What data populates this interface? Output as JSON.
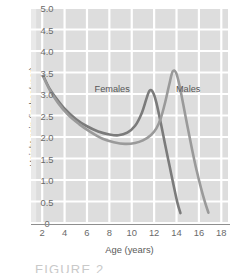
{
  "chart_data": {
    "type": "line",
    "title": "",
    "xlabel": "Age (years)",
    "ylabel": "Height gain (inches/year)",
    "xlim": [
      1,
      18.6
    ],
    "ylim": [
      0,
      5.0
    ],
    "xticks": [
      "2",
      "4",
      "6",
      "8",
      "10",
      "12",
      "14",
      "16",
      "18"
    ],
    "xtick_values": [
      2,
      4,
      6,
      8,
      10,
      12,
      14,
      16,
      18
    ],
    "yticks": [
      "5.0",
      "4.5",
      "4.0",
      "3.5",
      "3.0",
      "2.5",
      "2.0",
      "1.5",
      "1.0",
      "0.5",
      "0"
    ],
    "ytick_values": [
      5.0,
      4.5,
      4.0,
      3.5,
      3.0,
      2.5,
      2.0,
      1.5,
      1.0,
      0.5,
      0
    ],
    "grid": true,
    "grid_color": "#ffffff",
    "plot_background": "#dddddd",
    "legend_position": "inline-annotations",
    "series": [
      {
        "name": "Females",
        "color": "#7b7b7b",
        "label_x": 9.0,
        "label_y": 3.1,
        "points": [
          {
            "x": 2.1,
            "y": 3.42
          },
          {
            "x": 2.6,
            "y": 3.15
          },
          {
            "x": 3.2,
            "y": 2.92
          },
          {
            "x": 4.0,
            "y": 2.66
          },
          {
            "x": 5.0,
            "y": 2.42
          },
          {
            "x": 6.0,
            "y": 2.25
          },
          {
            "x": 7.0,
            "y": 2.13
          },
          {
            "x": 8.0,
            "y": 2.06
          },
          {
            "x": 8.8,
            "y": 2.04
          },
          {
            "x": 9.6,
            "y": 2.1
          },
          {
            "x": 10.3,
            "y": 2.26
          },
          {
            "x": 10.9,
            "y": 2.56
          },
          {
            "x": 11.3,
            "y": 2.88
          },
          {
            "x": 11.6,
            "y": 3.08
          },
          {
            "x": 11.9,
            "y": 3.04
          },
          {
            "x": 12.2,
            "y": 2.8
          },
          {
            "x": 12.6,
            "y": 2.32
          },
          {
            "x": 13.0,
            "y": 1.8
          },
          {
            "x": 13.4,
            "y": 1.3
          },
          {
            "x": 13.8,
            "y": 0.8
          },
          {
            "x": 14.1,
            "y": 0.45
          },
          {
            "x": 14.35,
            "y": 0.23
          }
        ]
      },
      {
        "name": "Males",
        "color": "#9a9a9a",
        "label_x": 15.2,
        "label_y": 3.1,
        "points": [
          {
            "x": 2.1,
            "y": 3.4
          },
          {
            "x": 2.7,
            "y": 3.08
          },
          {
            "x": 3.4,
            "y": 2.8
          },
          {
            "x": 4.3,
            "y": 2.52
          },
          {
            "x": 5.3,
            "y": 2.3
          },
          {
            "x": 6.3,
            "y": 2.12
          },
          {
            "x": 7.4,
            "y": 1.96
          },
          {
            "x": 8.4,
            "y": 1.88
          },
          {
            "x": 9.4,
            "y": 1.84
          },
          {
            "x": 10.3,
            "y": 1.86
          },
          {
            "x": 11.0,
            "y": 1.92
          },
          {
            "x": 11.7,
            "y": 2.04
          },
          {
            "x": 12.2,
            "y": 2.2
          },
          {
            "x": 12.6,
            "y": 2.44
          },
          {
            "x": 13.0,
            "y": 2.82
          },
          {
            "x": 13.35,
            "y": 3.22
          },
          {
            "x": 13.65,
            "y": 3.52
          },
          {
            "x": 13.95,
            "y": 3.5
          },
          {
            "x": 14.25,
            "y": 3.22
          },
          {
            "x": 14.6,
            "y": 2.76
          },
          {
            "x": 15.0,
            "y": 2.22
          },
          {
            "x": 15.4,
            "y": 1.7
          },
          {
            "x": 15.8,
            "y": 1.22
          },
          {
            "x": 16.2,
            "y": 0.8
          },
          {
            "x": 16.55,
            "y": 0.48
          },
          {
            "x": 16.85,
            "y": 0.24
          }
        ]
      }
    ]
  },
  "caption": {
    "text": "FIGURE 2"
  }
}
